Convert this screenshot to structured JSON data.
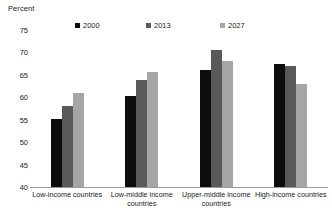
{
  "chart_data": {
    "type": "bar",
    "title": "",
    "subtitle": "",
    "ylabel": "Percent",
    "xlabel": "",
    "ylim": [
      40,
      75
    ],
    "yticks": [
      75,
      70,
      65,
      60,
      55,
      50,
      45,
      40
    ],
    "grid": false,
    "legend_position": "top",
    "categories": [
      "Low-income countries",
      "Low-middle income countries",
      "Upper-middle income countries",
      "High-income countries"
    ],
    "series": [
      {
        "name": "2000",
        "color": "#0d0d0d",
        "values": [
          55.1,
          60.3,
          66.1,
          67.5
        ]
      },
      {
        "name": "2013",
        "color": "#595959",
        "values": [
          58.0,
          63.8,
          70.6,
          66.9
        ]
      },
      {
        "name": "2027",
        "color": "#a6a6a6",
        "values": [
          60.9,
          65.6,
          68.1,
          63.0
        ]
      }
    ]
  },
  "axis": {
    "baseline_color": "#9a9a9a",
    "tick_text_color": "#1a1a1a"
  }
}
